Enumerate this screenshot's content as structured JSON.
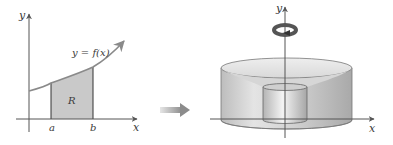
{
  "left_panel": {
    "y_axis_label": "y",
    "x_axis_label": "x",
    "curve_label": "y = f(x)",
    "region_label": "R",
    "a_label": "a",
    "b_label": "b",
    "region_fill": "#c9c9c9",
    "curve_color": "#8a8a8a"
  },
  "arrow": {
    "direction": "right",
    "color": "#9a9a9a"
  },
  "right_panel": {
    "y_axis_label": "y",
    "x_axis_label": "x",
    "rotation_icon": "rotation-arrow-icon",
    "solid_description": "solid of revolution about y-axis"
  }
}
